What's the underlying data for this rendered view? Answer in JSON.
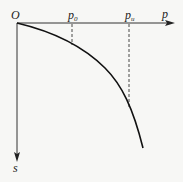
{
  "diagram": {
    "origin_label": "O",
    "x_axis_label": "p",
    "y_axis_label": "s",
    "markers": [
      {
        "base": "p",
        "sub": "0"
      },
      {
        "base": "p",
        "sub": "u"
      }
    ],
    "colors": {
      "line": "#1a1a1a",
      "background": "#f7f7f5"
    }
  }
}
